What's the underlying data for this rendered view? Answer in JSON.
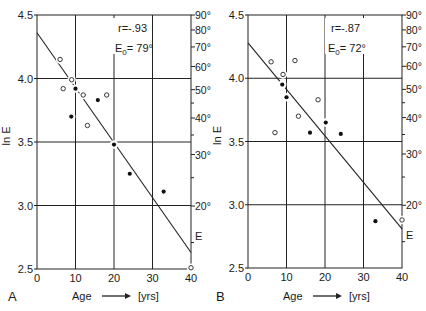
{
  "chart_data": [
    {
      "type": "scatter",
      "panel_label": "A",
      "xlabel": "Age",
      "xunit": "[yrs]",
      "ylabel": "ln E",
      "xlim": [
        0,
        40
      ],
      "ylim": [
        2.5,
        4.5
      ],
      "x_ticks": [
        "0",
        "10",
        "20",
        "30",
        "40"
      ],
      "y_ticks": [
        "2.5",
        "3.0",
        "3.5",
        "4.0",
        "4.5"
      ],
      "right_axis": {
        "label": "E",
        "ticks": [
          "90°",
          "80°",
          "70°",
          "60°",
          "50°",
          "40°",
          "30°",
          "20°"
        ],
        "values": [
          90,
          80,
          70,
          60,
          50,
          40,
          30,
          20
        ],
        "minor_values": [
          45,
          35,
          25,
          15
        ]
      },
      "grid": true,
      "annotations": {
        "r": "r=-.93",
        "e0_prefix": "E",
        "e0_sub": "0",
        "e0_value": "= 79°"
      },
      "series": [
        {
          "name": "open circles",
          "marker": "open",
          "points": [
            [
              6.0,
              4.15
            ],
            [
              9.0,
              3.99
            ],
            [
              6.8,
              3.92
            ],
            [
              12.0,
              3.87
            ],
            [
              18.1,
              3.87
            ],
            [
              13.1,
              3.63
            ],
            [
              40.0,
              2.51
            ]
          ]
        },
        {
          "name": "filled circles",
          "marker": "filled",
          "points": [
            [
              10.0,
              3.92
            ],
            [
              15.8,
              3.83
            ],
            [
              8.9,
              3.7
            ],
            [
              20.0,
              3.48
            ],
            [
              24.1,
              3.25
            ],
            [
              32.9,
              3.11
            ]
          ]
        }
      ],
      "regression_line": [
        [
          0,
          4.36
        ],
        [
          40,
          2.63
        ]
      ]
    },
    {
      "type": "scatter",
      "panel_label": "B",
      "xlabel": "Age",
      "xunit": "[yrs]",
      "ylabel": "ln E",
      "xlim": [
        0,
        40
      ],
      "ylim": [
        2.5,
        4.5
      ],
      "x_ticks": [
        "0",
        "10",
        "20",
        "30",
        "40"
      ],
      "y_ticks": [
        "2.5",
        "3.0",
        "3.5",
        "4.0",
        "4.5"
      ],
      "right_axis": {
        "label": "E",
        "ticks": [
          "90°",
          "80°",
          "70°",
          "60°",
          "50°",
          "40°",
          "30°",
          "20°"
        ],
        "values": [
          90,
          80,
          70,
          60,
          50,
          40,
          30,
          20
        ],
        "minor_values": [
          45,
          35,
          25,
          15
        ]
      },
      "grid": true,
      "annotations": {
        "r": "r=-.87",
        "e0_prefix": "E",
        "e0_sub": "0",
        "e0_value": "= 72°"
      },
      "series": [
        {
          "name": "open circles",
          "marker": "open",
          "points": [
            [
              6.0,
              4.13
            ],
            [
              12.2,
              4.14
            ],
            [
              9.1,
              4.03
            ],
            [
              18.2,
              3.83
            ],
            [
              13.1,
              3.7
            ],
            [
              7.0,
              3.57
            ],
            [
              40.0,
              2.88
            ]
          ]
        },
        {
          "name": "filled circles",
          "marker": "filled",
          "points": [
            [
              8.9,
              3.95
            ],
            [
              10.0,
              3.85
            ],
            [
              20.2,
              3.65
            ],
            [
              16.1,
              3.57
            ],
            [
              24.1,
              3.56
            ],
            [
              33.1,
              2.87
            ]
          ]
        }
      ],
      "regression_line": [
        [
          0,
          4.28
        ],
        [
          40,
          2.81
        ]
      ]
    }
  ],
  "figure": {
    "panels": [
      {
        "letter": "A",
        "age_label": "Age",
        "unit_label": "[yrs]",
        "y_title": "ln E",
        "e_label": "E"
      },
      {
        "letter": "B",
        "age_label": "Age",
        "unit_label": "[yrs]",
        "y_title": "ln E",
        "e_label": "E"
      }
    ]
  }
}
